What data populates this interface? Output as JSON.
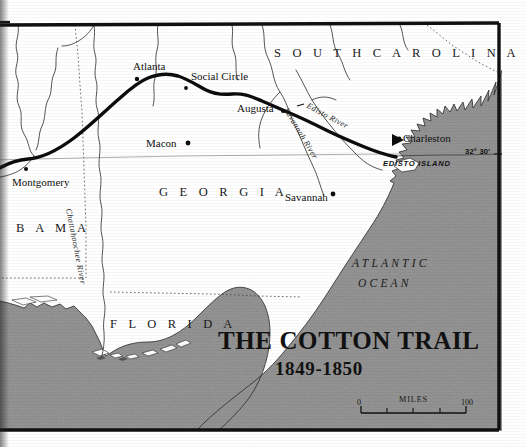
{
  "document": {
    "type": "historical-map",
    "title_line1": "THE COTTON TRAIL",
    "title_line2": "1849-1850"
  },
  "states": [
    {
      "name": "state-alabama",
      "label": "B A M A"
    },
    {
      "name": "state-georgia",
      "label": "G E O R G I A"
    },
    {
      "name": "state-florida",
      "label": "F L O R I D A"
    },
    {
      "name": "state-south-carolina",
      "label": "S O U T H   C A R O L I N A"
    }
  ],
  "cities": [
    {
      "name": "city-atlanta",
      "label": "Atlanta"
    },
    {
      "name": "city-social-circle",
      "label": "Social Circle"
    },
    {
      "name": "city-augusta",
      "label": "Augusta"
    },
    {
      "name": "city-macon",
      "label": "Macon"
    },
    {
      "name": "city-montgomery",
      "label": "Montgomery"
    },
    {
      "name": "city-savannah",
      "label": "Savannah"
    },
    {
      "name": "city-charleston",
      "label": "Charleston"
    }
  ],
  "rivers": [
    {
      "name": "river-chattahoochee",
      "label": "Chattahoochee River"
    },
    {
      "name": "river-savannah",
      "label": "Savannah River"
    },
    {
      "name": "river-edisto",
      "label": "Edisto River"
    }
  ],
  "water": {
    "ocean_line1": "ATLANTIC",
    "ocean_line2": "OCEAN"
  },
  "features": {
    "edisto_island": "EDISTO ISLAND"
  },
  "graticule": {
    "parallel_label": "32° 30'"
  },
  "scale_bar": {
    "unit_label": "MILES",
    "min_value": "0",
    "max_value": "100"
  },
  "colors": {
    "ocean_fill": "#8d8d8d",
    "land_fill": "#ffffff",
    "ink": "#111111",
    "frame": "#101010",
    "trail": "#0c0c0c",
    "river": "#2b2b2b",
    "page": "#ffffff"
  }
}
